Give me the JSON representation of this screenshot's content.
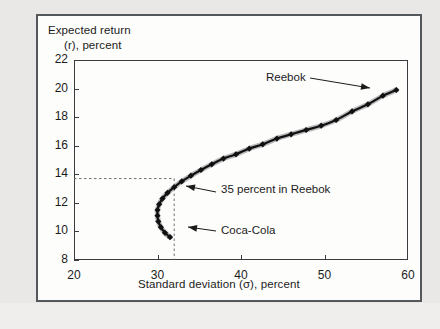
{
  "chart_data": {
    "type": "line",
    "title": "",
    "xlabel": "Standard deviation (σ), percent",
    "ylabel_line1": "Expected return",
    "ylabel_line2": "(r), percent",
    "xlim": [
      20,
      60
    ],
    "ylim": [
      8,
      22
    ],
    "xticks": [
      20,
      30,
      40,
      50,
      60
    ],
    "yticks": [
      8,
      10,
      12,
      14,
      16,
      18,
      20,
      22
    ],
    "grid": false,
    "legend": "none",
    "series": [
      {
        "name": "Portfolio frontier (Coca-Cola and Reebok)",
        "marker": "diamond",
        "x": [
          31.5,
          30.9,
          30.4,
          30.1,
          30.0,
          30.0,
          30.2,
          30.6,
          31.2,
          32.0,
          32.9,
          34.0,
          35.2,
          36.5,
          37.9,
          39.4,
          41.0,
          42.6,
          44.3,
          46.0,
          47.8,
          49.6,
          51.4,
          53.3,
          55.2,
          57.0,
          58.6
        ],
        "y": [
          9.6,
          9.9,
          10.3,
          10.7,
          11.1,
          11.5,
          11.9,
          12.3,
          12.7,
          13.1,
          13.5,
          13.9,
          14.3,
          14.7,
          15.1,
          15.4,
          15.8,
          16.1,
          16.5,
          16.8,
          17.1,
          17.4,
          17.8,
          18.4,
          18.9,
          19.5,
          19.9
        ]
      }
    ],
    "annotations": [
      {
        "label": "Reebok",
        "point_x": 58.6,
        "point_y": 19.9,
        "note": "100 percent Reebok endpoint, top right of frontier"
      },
      {
        "label": "35 percent in Reebok",
        "point_x": 32.0,
        "point_y": 13.7,
        "note": "tangency with dashed guide lines"
      },
      {
        "label": "Coca-Cola",
        "point_x": 31.5,
        "point_y": 9.6,
        "note": "100 percent Coca-Cola endpoint, bottom of frontier"
      }
    ],
    "guide_lines": [
      {
        "orientation": "horizontal",
        "value": 13.7,
        "style": "dashed"
      },
      {
        "orientation": "vertical",
        "value": 32.0,
        "style": "dashed"
      }
    ],
    "colors": {
      "curve": "#111111",
      "axis": "#3a3d3f",
      "text": "#1b1b1b",
      "frame": "#55585a",
      "page": "#e9e8e6",
      "plot_background": "#fdfdfc"
    }
  }
}
